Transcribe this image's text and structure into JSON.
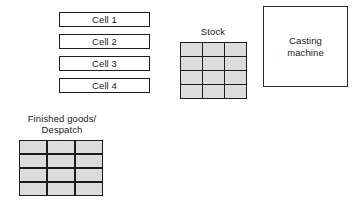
{
  "diagram": {
    "background_color": "#ffffff",
    "line_color": "#1c1c1c",
    "grid_fill_color": "#dcdcdc"
  },
  "cells": {
    "items": [
      {
        "label": "Cell 1"
      },
      {
        "label": "Cell 2"
      },
      {
        "label": "Cell 3"
      },
      {
        "label": "Cell 4"
      }
    ]
  },
  "stock": {
    "label": "Stock",
    "grid": {
      "columns": 3,
      "rows": 4,
      "fill": "#dcdcdc"
    }
  },
  "finished_goods": {
    "label": "Finished goods/\nDespatch",
    "grid": {
      "columns": 3,
      "rows": 4,
      "fill": "#dcdcdc"
    }
  },
  "casting_machine": {
    "label": "Casting\nmachine"
  }
}
